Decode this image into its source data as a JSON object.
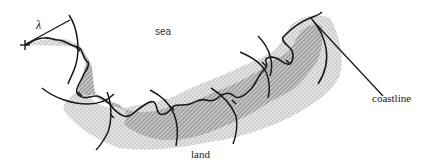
{
  "diagram": {
    "type": "coastline-divider-measurement",
    "labels": {
      "sea": "sea",
      "land": "land",
      "coastline": "coastline",
      "step_length": "λ"
    },
    "colors": {
      "ink": "#1a1a1a",
      "land_fill": "#9a9a9a",
      "land_fill_light": "#c8c8c8",
      "background": "#ffffff"
    },
    "start_marker": "+",
    "divider_steps": 8,
    "elements": [
      {
        "name": "coastline-curve",
        "description": "irregular boundary between sea (above) and land (below)"
      },
      {
        "name": "land-shading",
        "description": "stippled/hatched gray region below the coastline"
      },
      {
        "name": "divider-arcs",
        "description": "circular arcs of radius lambda marking successive steps along the coastline"
      },
      {
        "name": "step-radius-line",
        "description": "line from start point to first arc labeled lambda"
      },
      {
        "name": "coastline-leader-line",
        "description": "pointer line from coastline label to the end of the coastline"
      }
    ]
  }
}
